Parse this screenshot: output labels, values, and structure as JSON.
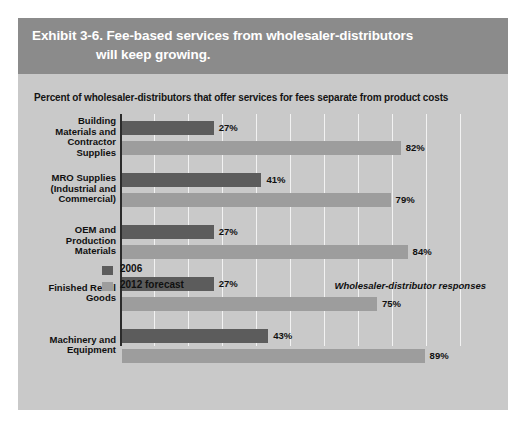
{
  "exhibit": {
    "title_line1": "Exhibit 3-6. Fee-based services from wholesaler-distributors",
    "title_line2": "will keep growing.",
    "subtitle": "Percent of wholesaler-distributors that offer services for fees separate from product costs",
    "source_note": "Wholesaler-distributor responses"
  },
  "colors": {
    "header_band": "#8b8b8b",
    "panel_background": "#c9c9c9",
    "series_2006": "#5c5c5c",
    "series_2012": "#9d9d9d",
    "gridline": "#f2f2f2",
    "axis": "#2b2b2b",
    "title_text": "#ffffff",
    "body_text": "#101010"
  },
  "legend": {
    "items": [
      {
        "label": "2006",
        "swatch": "#5c5c5c"
      },
      {
        "label": "2012 forecast",
        "swatch": "#9d9d9d"
      }
    ]
  },
  "chart_data": {
    "type": "bar",
    "orientation": "horizontal",
    "title": "Exhibit 3-6. Fee-based services from wholesaler-distributors will keep growing.",
    "subtitle": "Percent of wholesaler-distributors that offer services for fees separate from product costs",
    "xlabel": "",
    "ylabel": "",
    "xlim": [
      0,
      100
    ],
    "grid": true,
    "grid_step": 10,
    "legend_position": "bottom-left",
    "value_suffix": "%",
    "categories": [
      "Building Materials and Contractor Supplies",
      "MRO Supplies (Industrial and Commercial)",
      "OEM and Production Materials",
      "Finished Retail Goods",
      "Machinery and Equipment"
    ],
    "category_lines": [
      [
        "Building",
        "Materials and",
        "Contractor",
        "Supplies"
      ],
      [
        "MRO Supplies",
        "(Industrial and",
        "Commercial)"
      ],
      [
        "OEM and",
        "Production",
        "Materials"
      ],
      [
        "Finished Retail",
        "Goods"
      ],
      [
        "Machinery and",
        "Equipment"
      ]
    ],
    "series": [
      {
        "name": "2006",
        "values": [
          27,
          41,
          27,
          27,
          43
        ],
        "labels": [
          "27%",
          "41%",
          "27%",
          "27%",
          "43%"
        ]
      },
      {
        "name": "2012 forecast",
        "values": [
          82,
          79,
          84,
          75,
          89
        ],
        "labels": [
          "82%",
          "79%",
          "84%",
          "75%",
          "89%"
        ]
      }
    ]
  }
}
